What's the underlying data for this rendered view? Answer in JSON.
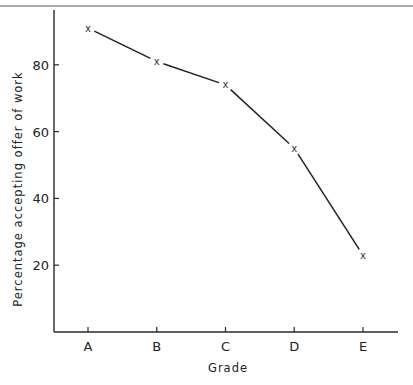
{
  "chart_data": {
    "type": "line",
    "title": "",
    "xlabel": "Grade",
    "ylabel": "Percentage accepting offer of work",
    "categories": [
      "A",
      "B",
      "C",
      "D",
      "E"
    ],
    "values": [
      91,
      81,
      74,
      55,
      23
    ],
    "series": [
      {
        "name": "Percentage accepting offer of work",
        "marker": "x",
        "values": [
          91,
          81,
          74,
          55,
          23
        ]
      }
    ],
    "ylim": [
      0,
      100
    ],
    "yticks": [
      20,
      40,
      60,
      80
    ],
    "grid": false,
    "legend": "none"
  },
  "colors": {
    "ink": "#222222",
    "background": "#ffffff"
  }
}
